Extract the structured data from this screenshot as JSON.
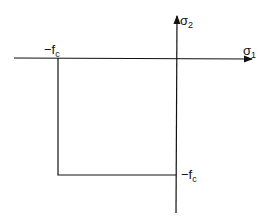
{
  "diagram": {
    "type": "yield-criterion",
    "axes": {
      "horizontal": {
        "symbol": "σ",
        "subscript": "1"
      },
      "vertical": {
        "symbol": "σ",
        "subscript": "2"
      }
    },
    "labels": {
      "left_corner": {
        "prefix": "−f",
        "subscript": "c"
      },
      "bottom_corner": {
        "prefix": "−f",
        "subscript": "c"
      }
    },
    "colors": {
      "line": "#111111",
      "background": "#ffffff"
    }
  }
}
